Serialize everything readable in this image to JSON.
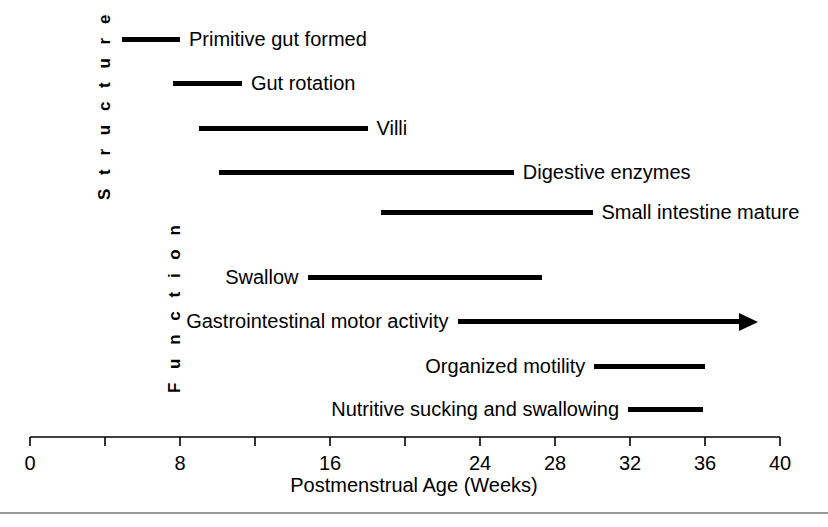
{
  "figure": {
    "width": 828,
    "height": 527,
    "background": "#ffffff",
    "ink_color": "#000000",
    "rule_color": "#9a9a9a"
  },
  "sections": {
    "structure_label": "S t r u c t u r e",
    "function_label": "F u n c t i o n"
  },
  "axis": {
    "title": "Postmenstrual Age (Weeks)",
    "x_pixel_at_zero": 30,
    "x_pixel_at_forty": 780,
    "tick_values": [
      0,
      4,
      8,
      12,
      16,
      20,
      24,
      28,
      32,
      36,
      40
    ],
    "tick_labels": [
      "0",
      "",
      "8",
      "",
      "16",
      "",
      "24",
      "28",
      "32",
      "36",
      "40"
    ],
    "visible_tick_labels": [
      "0",
      "8",
      "16",
      "24",
      "28",
      "32",
      "36",
      "40"
    ],
    "range": [
      0,
      40
    ],
    "units": "weeks"
  },
  "chart_data": {
    "type": "bar",
    "title": "",
    "subtitle": "",
    "xlabel": "Postmenstrual Age (Weeks)",
    "ylabel": "",
    "xlim": [
      0,
      40
    ],
    "grid": false,
    "legend": "none",
    "orientation": "horizontal-timeline",
    "axis_ticks": [
      0,
      4,
      8,
      12,
      16,
      20,
      24,
      28,
      32,
      36,
      40
    ],
    "axis_tick_labels_shown": [
      0,
      8,
      16,
      24,
      28,
      32,
      36,
      40
    ],
    "groups": [
      {
        "name": "Structure",
        "items": [
          {
            "label": "Primitive gut formed",
            "start": 4.9,
            "end": 8.0,
            "label_side": "right",
            "open_ended": false,
            "row_top": 27
          },
          {
            "label": "Gut rotation",
            "start": 7.6,
            "end": 11.3,
            "label_side": "right",
            "open_ended": false,
            "row_top": 71
          },
          {
            "label": "Villi",
            "start": 9.0,
            "end": 18.0,
            "label_side": "right",
            "open_ended": false,
            "row_top": 116
          },
          {
            "label": "Digestive enzymes",
            "start": 10.1,
            "end": 25.8,
            "label_side": "right",
            "open_ended": false,
            "row_top": 160
          },
          {
            "label": "Small intestine mature",
            "start": 18.7,
            "end": 30.0,
            "label_side": "right",
            "open_ended": false,
            "row_top": 200
          }
        ]
      },
      {
        "name": "Function",
        "items": [
          {
            "label": "Swallow",
            "start": 14.8,
            "end": 27.3,
            "label_side": "left",
            "open_ended": false,
            "row_top": 265
          },
          {
            "label": "Gastrointestinal motor activity",
            "start": 22.8,
            "end": 38.8,
            "label_side": "left",
            "open_ended": true,
            "row_top": 309
          },
          {
            "label": "Organized motility",
            "start": 30.1,
            "end": 36.0,
            "label_side": "left",
            "open_ended": false,
            "row_top": 354
          },
          {
            "label": "Nutritive sucking and swallowing",
            "start": 31.9,
            "end": 35.9,
            "label_side": "left",
            "open_ended": false,
            "row_top": 397
          }
        ]
      }
    ]
  }
}
